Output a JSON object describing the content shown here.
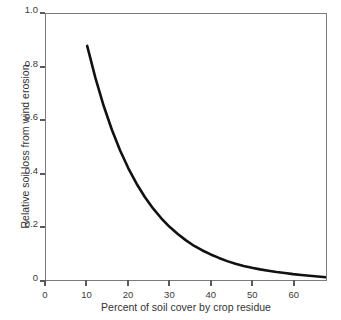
{
  "chart_data": {
    "type": "line",
    "title": "",
    "subtitle": "",
    "xlabel": "Percent of soil cover by crop residue",
    "ylabel": "Relative soil loss from wind erosion",
    "xlim": [
      0,
      68
    ],
    "ylim": [
      0,
      1.0
    ],
    "grid": false,
    "legend": null,
    "legend_position": "none",
    "frame": "box",
    "xticks": [
      0,
      10,
      20,
      30,
      40,
      50,
      60
    ],
    "xtick_labels": [
      "0",
      "10",
      "20",
      "30",
      "40",
      "50",
      "60"
    ],
    "yticks": [
      0,
      0.2,
      0.4,
      0.6,
      0.8,
      1.0
    ],
    "ytick_labels": [
      "0",
      "0.2",
      "0.4",
      "0.6",
      "0.8",
      "1.0"
    ],
    "series": [
      {
        "name": "Relative soil loss",
        "color": "#111111",
        "line_width": 2.6,
        "x": [
          10,
          12,
          14,
          16,
          18,
          20,
          22,
          24,
          26,
          28,
          30,
          32,
          34,
          36,
          38,
          40,
          42,
          44,
          46,
          48,
          50,
          52,
          54,
          56,
          58,
          60,
          62,
          64,
          66,
          68
        ],
        "y": [
          0.88,
          0.76,
          0.655,
          0.565,
          0.487,
          0.42,
          0.362,
          0.312,
          0.269,
          0.232,
          0.2,
          0.173,
          0.149,
          0.128,
          0.111,
          0.096,
          0.083,
          0.071,
          0.061,
          0.053,
          0.046,
          0.04,
          0.035,
          0.03,
          0.026,
          0.022,
          0.019,
          0.016,
          0.013,
          0.01
        ]
      }
    ],
    "annotations": []
  },
  "axes": {
    "x_title": "Percent of soil cover by crop residue",
    "y_title": "Relative soil loss from wind erosion"
  },
  "colors": {
    "curve": "#111111",
    "frame": "#7b7b7b",
    "tick": "#5a5a5a",
    "text": "#333333",
    "background": "#ffffff"
  }
}
